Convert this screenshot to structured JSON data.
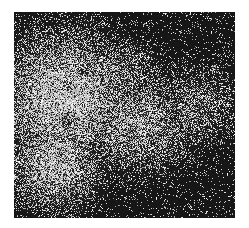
{
  "image": {
    "description": "Grayscale fluorescence-like micrograph with bright diffuse noisy cloud and dark spots",
    "background_color": "#ffffff",
    "frame": {
      "x": 14,
      "y": 12,
      "width": 221,
      "height": 206
    },
    "base_dark": "#1c1c1c",
    "bright_regions": [
      {
        "cx": 50,
        "cy": 85,
        "rx": 70,
        "ry": 70,
        "intensity": 0.85
      },
      {
        "cx": 40,
        "cy": 150,
        "rx": 50,
        "ry": 50,
        "intensity": 0.75
      },
      {
        "cx": 120,
        "cy": 110,
        "rx": 70,
        "ry": 55,
        "intensity": 0.6
      },
      {
        "cx": 180,
        "cy": 95,
        "rx": 50,
        "ry": 45,
        "intensity": 0.45
      },
      {
        "cx": 100,
        "cy": 60,
        "rx": 50,
        "ry": 35,
        "intensity": 0.5
      }
    ],
    "dark_spots": [
      {
        "cx": 55,
        "cy": 108,
        "r": 8
      },
      {
        "cx": 52,
        "cy": 72,
        "r": 6
      },
      {
        "cx": 68,
        "cy": 57,
        "r": 6
      },
      {
        "cx": 160,
        "cy": 103,
        "r": 4
      }
    ],
    "small_bright_blobs": [
      {
        "cx": 200,
        "cy": 55,
        "r": 5
      },
      {
        "cx": 95,
        "cy": 123,
        "r": 4
      }
    ]
  }
}
